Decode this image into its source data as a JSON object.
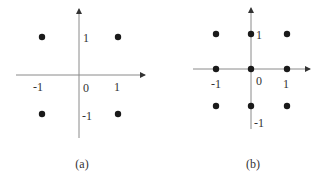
{
  "colors": {
    "axis": "#8a8a8a",
    "dot": "#1a1a1a",
    "text": "#333333",
    "background": "#ffffff"
  },
  "panels": [
    {
      "caption": "(a)",
      "labels": {
        "x_neg": "-1",
        "x_origin": "0",
        "x_pos": "1",
        "y_pos": "1",
        "y_neg": "-1"
      },
      "points": [
        {
          "x": -1,
          "y": 1
        },
        {
          "x": 1,
          "y": 1
        },
        {
          "x": -1,
          "y": -1
        },
        {
          "x": 1,
          "y": -1
        }
      ]
    },
    {
      "caption": "(b)",
      "labels": {
        "x_neg": "-1",
        "x_origin": "0",
        "x_pos": "1",
        "y_pos": "1",
        "y_neg": "-1"
      },
      "points": [
        {
          "x": -1,
          "y": 1
        },
        {
          "x": 0,
          "y": 1
        },
        {
          "x": 1,
          "y": 1
        },
        {
          "x": -1,
          "y": 0
        },
        {
          "x": 0,
          "y": 0
        },
        {
          "x": 1,
          "y": 0
        },
        {
          "x": -1,
          "y": -1
        },
        {
          "x": 0,
          "y": -1
        },
        {
          "x": 1,
          "y": -1
        }
      ]
    }
  ]
}
